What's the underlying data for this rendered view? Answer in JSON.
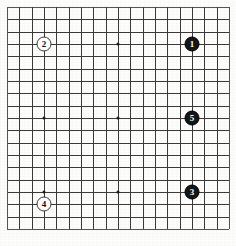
{
  "figure": {
    "kind": "go-board-diagram",
    "board_size": 19,
    "title": "",
    "caption": ""
  },
  "board": {
    "columns": 19,
    "rows": 19,
    "left_px": 7,
    "top_px": 7,
    "cell_px": 12.33,
    "line_color": "#3a3a3a",
    "edge_color": "#555555",
    "background_color": "#fdfdfc",
    "star_point_color": "#1b1b1b",
    "star_points": [
      {
        "col": 4,
        "row": 4
      },
      {
        "col": 10,
        "row": 4
      },
      {
        "col": 16,
        "row": 4
      },
      {
        "col": 4,
        "row": 10
      },
      {
        "col": 10,
        "row": 10
      },
      {
        "col": 16,
        "row": 10
      },
      {
        "col": 4,
        "row": 16
      },
      {
        "col": 10,
        "row": 16
      },
      {
        "col": 16,
        "row": 16
      }
    ]
  },
  "stones": [
    {
      "label": "1",
      "color": "black",
      "col": 16,
      "row": 4,
      "name": "stone-1-black"
    },
    {
      "label": "2",
      "color": "white",
      "col": 4,
      "row": 4,
      "name": "stone-2-white"
    },
    {
      "label": "3",
      "color": "black",
      "col": 16,
      "row": 16,
      "name": "stone-3-black"
    },
    {
      "label": "4",
      "color": "white",
      "col": 4,
      "row": 17,
      "name": "stone-4-white"
    },
    {
      "label": "5",
      "color": "black",
      "col": 16,
      "row": 10,
      "name": "stone-5-black"
    }
  ],
  "colors": {
    "black_stone_fill": "#161616",
    "black_stone_text": "#ffffff",
    "white_stone_fill": "#ffffff",
    "white_stone_text": "#111111",
    "white_stone_border": "#3a3a3a"
  }
}
